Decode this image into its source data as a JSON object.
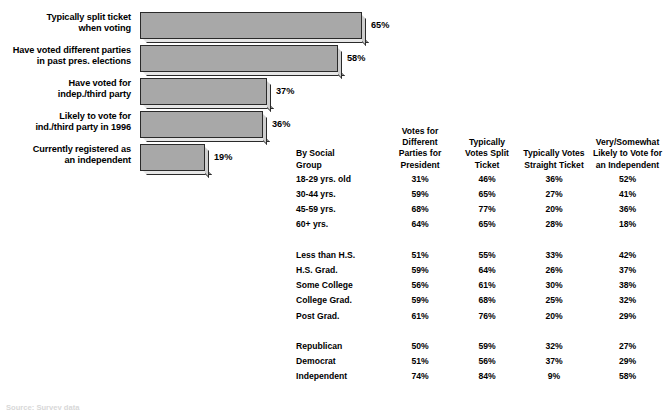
{
  "chart_data": {
    "type": "bar",
    "orientation": "horizontal",
    "title": "",
    "xlabel": "",
    "ylabel": "",
    "grid": false,
    "legend": "none",
    "xlim": [
      0,
      72
    ],
    "categories": [
      "Typically split ticket when voting",
      "Have voted different parties in past pres. elections",
      "Have voted for indep./third party",
      "Likely to vote for ind./third party in 1996",
      "Currently registered as an independent"
    ],
    "values": [
      65,
      58,
      37,
      36,
      19
    ],
    "value_labels": [
      "65%",
      "58%",
      "37%",
      "36%",
      "19%"
    ],
    "bars": [
      {
        "line1": "Typically split ticket",
        "line2": "when voting",
        "value": 65,
        "label": "65%"
      },
      {
        "line1": "Have voted different parties",
        "line2": "in past pres. elections",
        "value": 58,
        "label": "58%"
      },
      {
        "line1": "Have voted for",
        "line2": "indep./third party",
        "value": 37,
        "label": "37%"
      },
      {
        "line1": "Likely to vote for",
        "line2": "ind./third party in 1996",
        "value": 36,
        "label": "36%"
      },
      {
        "line1": "Currently registered as",
        "line2": "an  independent",
        "value": 19,
        "label": "19%"
      }
    ],
    "bar_fill_color": "#a8a8a8",
    "bar_border_color": "#2a2a2a"
  },
  "table": {
    "headers": [
      {
        "line1": "By Social",
        "line2": "Group",
        "line3": "",
        "line4": ""
      },
      {
        "line1": "Votes for",
        "line2": "Different",
        "line3": "Parties for",
        "line4": "President"
      },
      {
        "line1": "Typically",
        "line2": "Votes Split",
        "line3": "Ticket",
        "line4": ""
      },
      {
        "line1": "Typically Votes",
        "line2": "Straight Ticket",
        "line3": "",
        "line4": ""
      },
      {
        "line1": "Very/Somewhat",
        "line2": "Likely to Vote for",
        "line3": "an Independent",
        "line4": ""
      }
    ],
    "rows": [
      {
        "group": "18-29 yrs. old",
        "c1": "31%",
        "c2": "46%",
        "c3": "36%",
        "c4": "52%"
      },
      {
        "group": "30-44 yrs.",
        "c1": "59%",
        "c2": "65%",
        "c3": "27%",
        "c4": "41%"
      },
      {
        "group": "45-59 yrs.",
        "c1": "68%",
        "c2": "77%",
        "c3": "20%",
        "c4": "36%"
      },
      {
        "group": "60+ yrs.",
        "c1": "64%",
        "c2": "65%",
        "c3": "28%",
        "c4": "18%"
      },
      {
        "group": "Less than H.S.",
        "c1": "51%",
        "c2": "55%",
        "c3": "33%",
        "c4": "42%"
      },
      {
        "group": "H.S. Grad.",
        "c1": "59%",
        "c2": "64%",
        "c3": "26%",
        "c4": "37%"
      },
      {
        "group": "Some College",
        "c1": "56%",
        "c2": "61%",
        "c3": "30%",
        "c4": "38%"
      },
      {
        "group": "College Grad.",
        "c1": "59%",
        "c2": "68%",
        "c3": "25%",
        "c4": "32%"
      },
      {
        "group": "Post Grad.",
        "c1": "61%",
        "c2": "76%",
        "c3": "20%",
        "c4": "29%"
      },
      {
        "group": "Republican",
        "c1": "50%",
        "c2": "59%",
        "c3": "32%",
        "c4": "27%"
      },
      {
        "group": "Democrat",
        "c1": "51%",
        "c2": "56%",
        "c3": "37%",
        "c4": "29%"
      },
      {
        "group": "Independent",
        "c1": "74%",
        "c2": "84%",
        "c3": "9%",
        "c4": "58%"
      }
    ],
    "group_breaks": [
      4,
      9
    ]
  },
  "footer": {
    "source": "Source: Survey data"
  }
}
